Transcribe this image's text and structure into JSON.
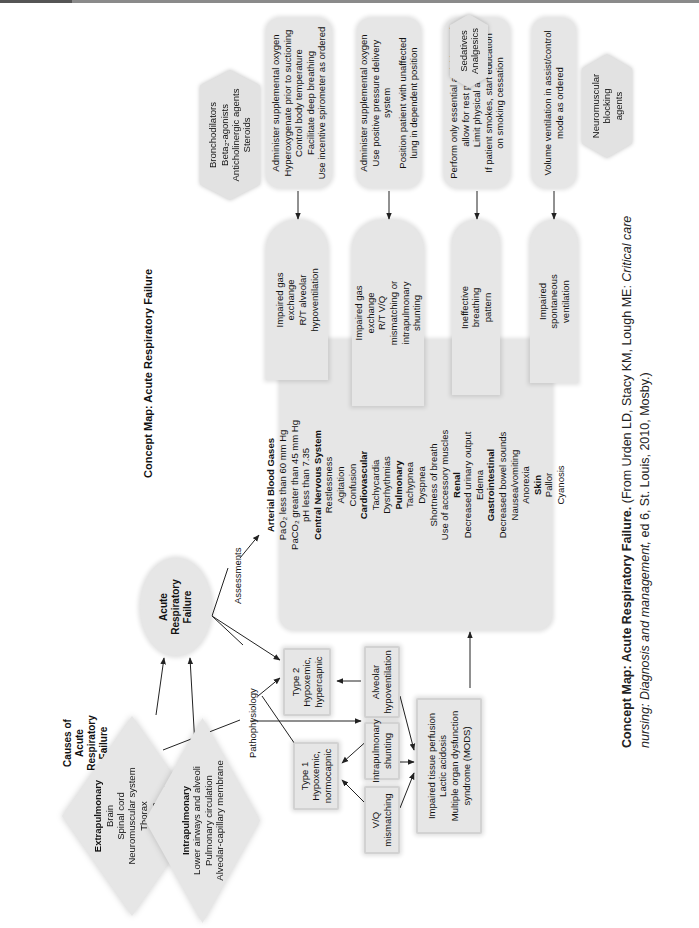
{
  "title": "Concept Map: Acute Respiratory Failure",
  "causes_title": [
    "Causes of",
    "Acute",
    "Respiratory",
    "Failure"
  ],
  "center_node": [
    "Acute",
    "Respiratory",
    "Failure"
  ],
  "edge_labels": {
    "assessments": "Assessments",
    "pathophysiology": "Pathophysiology"
  },
  "causes": {
    "extrapulmonary": {
      "heading": "Extrapulmonary",
      "items": [
        "Brain",
        "Spinal cord",
        "Neuromuscular system",
        "Thorax",
        "Pleura",
        "Upper airways"
      ]
    },
    "intrapulmonary": {
      "heading": "Intrapulmonary",
      "items": [
        "Lower airways and alveoli",
        "Pulmonary circulation",
        "Alveolar-capillary membrane"
      ]
    }
  },
  "pathophysiology": {
    "type1": [
      "Type 1",
      "Hypoxemic,",
      "normocapnic"
    ],
    "type2": [
      "Type 2",
      "Hypoxemic,",
      "hypercapnic"
    ],
    "vq": [
      "V/Q",
      "mismatching"
    ],
    "shunting": [
      "Intrapulmonary",
      "shunting"
    ],
    "alveolar": [
      "Alveolar",
      "hypoventilation"
    ],
    "impaired_perfusion": [
      "Impaired tissue perfusion",
      "Lactic acidosis",
      "Multiple organ dysfunction",
      "syndrome (MODS)"
    ]
  },
  "assessments": {
    "sections": [
      {
        "heading": "Arterial Blood Gases",
        "items": [
          "Pa O₂ less than 60 mm Hg",
          "PaCO₂ greater than 45 mm Hg",
          "pH less than 7.35"
        ]
      },
      {
        "heading": "Central Nervous System",
        "items": [
          "Restlessness",
          "Agitation",
          "Confusion"
        ]
      },
      {
        "heading": "Cardiovascular",
        "items": [
          "Tachycardia",
          "Dysrhythmias"
        ]
      },
      {
        "heading": "Pulmonary",
        "items": [
          "Tachypnea",
          "Dyspnea",
          "Shortness of breath",
          "Use of accessory muscles"
        ]
      },
      {
        "heading": "Renal",
        "items": [
          "Decreased urinary output",
          "Edema"
        ]
      },
      {
        "heading": "Gastrointestinal",
        "items": [
          "Decreased bowel sounds",
          "Nausea/vomiting",
          "Anorexia"
        ]
      },
      {
        "heading": "Skin",
        "items": [
          "Pallor",
          "Cyanosis"
        ]
      }
    ]
  },
  "diagnoses": [
    {
      "lines": [
        "Impaired gas",
        "exchange",
        "R/T alveolar",
        "hypoventilation"
      ]
    },
    {
      "lines": [
        "Impaired gas",
        "exchange",
        "R/T V/Q",
        "mismatching or",
        "intrapulmonary",
        "shunting"
      ]
    },
    {
      "lines": [
        "Ineffective",
        "breathing",
        "pattern"
      ]
    },
    {
      "lines": [
        "Impaired",
        "spontaneous",
        "ventilation"
      ]
    }
  ],
  "interventions": [
    {
      "lines": [
        "Administer supplemental oxygen",
        "Hyperoxygenate prior to suctioning",
        "Control body temperature",
        "Facilitate deep breathing",
        "Use incentive spirometer as ordered"
      ]
    },
    {
      "lines": [
        "Administer supplemental oxygen",
        "Use positive pressure delivery",
        "system",
        "Position patient with unaffected",
        "lung in dependent position"
      ]
    },
    {
      "lines": [
        "Perform only essential activities and",
        "allow for rest periods",
        "Limit physical activity",
        "If patient smokes, start education",
        "on smoking cessation"
      ]
    },
    {
      "lines": [
        "Volume ventilation in assist/control",
        "mode as ordered"
      ]
    }
  ],
  "medications": [
    {
      "lines": [
        "Bronchodilators",
        "Beta₂-agonists",
        "Anticholinergic agents",
        "Steroids"
      ]
    },
    {
      "lines": [
        "Sedatives",
        "Analgesics"
      ]
    },
    {
      "lines": [
        "Neuromuscular",
        "blocking",
        "agents"
      ]
    }
  ],
  "caption": {
    "bold": "Concept Map: Acute Respiratory Failure.",
    "line1_rest": " (From Urden LD, Stacy KM, Lough ME: ",
    "italic1": "Critical care",
    "italic2": "nursing: Diagnosis and management,",
    "line2_rest": " ed 6, St. Louis, 2010, Mosby.)"
  },
  "colors": {
    "node_fill": "#e6e6e6",
    "node_border": "#d2d2d2",
    "line": "#222222",
    "text": "#111111"
  }
}
